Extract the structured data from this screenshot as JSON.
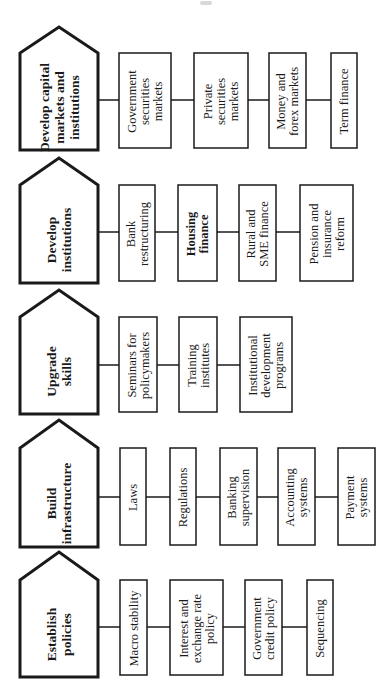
{
  "diagram": {
    "orientation": "rotated-90-ccw",
    "stroke_color": "#1a1a1a",
    "background": "#ffffff",
    "pillars": [
      {
        "title_lines": [
          "Develop capital",
          "markets and",
          "institutions"
        ],
        "items": [
          {
            "lines": [
              "Government",
              "securities",
              "markets"
            ],
            "bold": false
          },
          {
            "lines": [
              "Private",
              "securities",
              "markets"
            ],
            "bold": false
          },
          {
            "lines": [
              "Money and",
              "forex markets"
            ],
            "bold": false
          },
          {
            "lines": [
              "Term finance"
            ],
            "bold": false
          }
        ]
      },
      {
        "title_lines": [
          "Develop",
          "institutions"
        ],
        "items": [
          {
            "lines": [
              "Bank",
              "restructuring"
            ],
            "bold": false
          },
          {
            "lines": [
              "Housing",
              "finance"
            ],
            "bold": true
          },
          {
            "lines": [
              "Rural and",
              "SME finance"
            ],
            "bold": false
          },
          {
            "lines": [
              "Pension and",
              "insurance",
              "reform"
            ],
            "bold": false
          }
        ]
      },
      {
        "title_lines": [
          "Upgrade",
          "skills"
        ],
        "items": [
          {
            "lines": [
              "Seminars for",
              "policymakers"
            ],
            "bold": false
          },
          {
            "lines": [
              "Training",
              "institutes"
            ],
            "bold": false
          },
          {
            "lines": [
              "Institutional",
              "development",
              "programs"
            ],
            "bold": false
          }
        ]
      },
      {
        "title_lines": [
          "Build",
          "infrastructure"
        ],
        "items": [
          {
            "lines": [
              "Laws"
            ],
            "bold": false
          },
          {
            "lines": [
              "Regulations"
            ],
            "bold": false
          },
          {
            "lines": [
              "Banking",
              "supervision"
            ],
            "bold": false
          },
          {
            "lines": [
              "Accounting",
              "systems"
            ],
            "bold": false
          },
          {
            "lines": [
              "Payment",
              "systems"
            ],
            "bold": false
          }
        ]
      },
      {
        "title_lines": [
          "Establish",
          "policies"
        ],
        "items": [
          {
            "lines": [
              "Macro stability"
            ],
            "bold": false
          },
          {
            "lines": [
              "Interest and",
              "exchange rate",
              "policy"
            ],
            "bold": false
          },
          {
            "lines": [
              "Government",
              "credit policy"
            ],
            "bold": false
          },
          {
            "lines": [
              "Sequencing"
            ],
            "bold": false
          }
        ]
      }
    ]
  }
}
